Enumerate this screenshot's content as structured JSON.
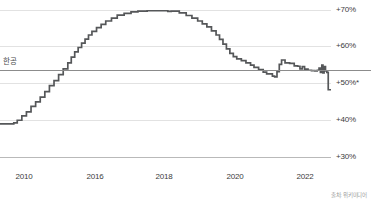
{
  "chart_data": {
    "type": "line",
    "title": "",
    "subtitle": "",
    "xlabel": "",
    "ylabel": "",
    "xlim": [
      2009.0,
      2023.4
    ],
    "ylim": [
      28.0,
      72.0
    ],
    "grid": true,
    "legend_position": "none",
    "x_ticks": [
      {
        "value": 2010,
        "label": "2010"
      },
      {
        "value": 2016,
        "label": "2016"
      },
      {
        "value": 2018,
        "label": "2018"
      },
      {
        "value": 2020,
        "label": "2020"
      },
      {
        "value": 2022,
        "label": "2022"
      }
    ],
    "y_ticks": [
      {
        "value": 70,
        "label": "+70%"
      },
      {
        "value": 60,
        "label": "+60%"
      },
      {
        "value": 50,
        "label": "+50%*"
      },
      {
        "value": 40,
        "label": "+40%"
      },
      {
        "value": 30,
        "label": "+30%"
      }
    ],
    "annotations": [
      {
        "name": "average-line",
        "label": "한공",
        "value": 53.5,
        "type": "hline"
      }
    ],
    "series": [
      {
        "name": "rate",
        "step": "post",
        "color": "#555759",
        "x": [
          2009.0,
          2009.45,
          2009.6,
          2009.75,
          2009.95,
          2010.15,
          2010.35,
          2010.55,
          2010.75,
          2010.95,
          2011.15,
          2011.35,
          2011.55,
          2011.75,
          2011.95,
          2012.1,
          2012.25,
          2012.4,
          2012.55,
          2012.7,
          2012.85,
          2013.0,
          2013.2,
          2013.4,
          2013.6,
          2013.85,
          2014.1,
          2014.4,
          2014.7,
          2015.0,
          2015.4,
          2015.9,
          2016.3,
          2016.45,
          2016.8,
          2017.1,
          2017.35,
          2017.6,
          2017.8,
          2018.0,
          2018.2,
          2018.4,
          2018.55,
          2018.7,
          2018.85,
          2019.0,
          2019.15,
          2019.3,
          2019.5,
          2019.7,
          2019.9,
          2020.05,
          2020.25,
          2020.45,
          2020.6,
          2020.75,
          2020.85,
          2020.95,
          2021.05,
          2021.15,
          2021.25,
          2021.4,
          2021.6,
          2021.8,
          2021.95,
          2022.05,
          2022.15,
          2022.25,
          2022.4,
          2022.55,
          2022.7,
          2022.8,
          2022.88,
          2022.94,
          2023.0,
          2023.05,
          2023.1,
          2023.16,
          2023.22,
          2023.28,
          2023.4
        ],
        "values": [
          39.0,
          39.0,
          39.3,
          40.0,
          41.2,
          42.3,
          43.8,
          45.0,
          46.3,
          47.8,
          49.4,
          50.8,
          52.4,
          54.0,
          55.6,
          57.2,
          58.6,
          59.8,
          61.0,
          62.1,
          63.2,
          64.2,
          65.2,
          66.1,
          67.0,
          67.8,
          68.6,
          69.1,
          69.5,
          69.7,
          69.8,
          69.8,
          69.6,
          69.7,
          69.2,
          68.5,
          67.8,
          67.0,
          66.2,
          65.4,
          64.3,
          63.2,
          62.0,
          60.7,
          59.4,
          58.2,
          57.3,
          56.7,
          56.2,
          55.6,
          55.0,
          54.4,
          53.8,
          53.1,
          52.6,
          52.6,
          52.0,
          51.8,
          53.2,
          55.2,
          56.4,
          55.6,
          55.5,
          54.8,
          54.7,
          54.0,
          54.6,
          53.9,
          53.6,
          53.5,
          53.4,
          53.6,
          54.2,
          53.0,
          55.0,
          52.9,
          54.6,
          53.4,
          53.0,
          48.3,
          48.4
        ]
      }
    ]
  },
  "footer": {
    "source_text": "출처: 위키미디어"
  }
}
